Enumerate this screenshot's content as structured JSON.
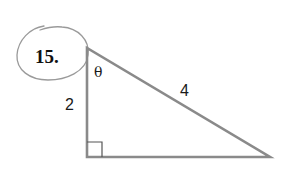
{
  "problem": {
    "number": "15.",
    "circled": true
  },
  "triangle": {
    "type": "right-triangle",
    "vertices": {
      "top": [
        87,
        48
      ],
      "right_angle": [
        87,
        157
      ],
      "right": [
        270,
        157
      ]
    },
    "labels": {
      "angle": "θ",
      "vertical_leg": "2",
      "hypotenuse": "4"
    },
    "right_angle_marker": true,
    "stroke_color": "#8a8a8a",
    "circle_color": "#9a9a9a"
  }
}
